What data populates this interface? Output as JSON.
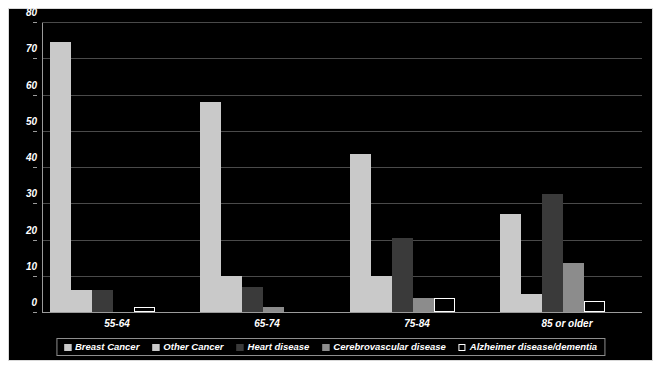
{
  "chart_data": {
    "type": "bar",
    "title": "",
    "subtitle": "",
    "xlabel": "",
    "ylabel": "",
    "grid": true,
    "legend_position": "bottom",
    "ylim": [
      0,
      80
    ],
    "ytick_labels": [
      "0",
      "10",
      "20",
      "30",
      "40",
      "50",
      "60",
      "70",
      "80"
    ],
    "ytick_values": [
      0,
      10,
      20,
      30,
      40,
      50,
      60,
      70,
      80
    ],
    "categories": [
      "55-64",
      "65-74",
      "75-84",
      "85 or older"
    ],
    "series": [
      {
        "name": "Breast Cancer",
        "color": "#c9c9c9",
        "values": [
          74.5,
          58,
          43.5,
          27
        ]
      },
      {
        "name": "Other Cancer",
        "color": "#c9c9c9",
        "values": [
          6,
          10,
          10,
          5
        ]
      },
      {
        "name": "Heart disease",
        "color": "#3a3a3a",
        "values": [
          6,
          7,
          20.5,
          32.5
        ]
      },
      {
        "name": "Cerebrovascular disease",
        "color": "#8c8c8c",
        "values": [
          0,
          1.5,
          4,
          13.5
        ]
      },
      {
        "name": "Alzheimer disease/dementia",
        "color": "#000000",
        "values": [
          1.5,
          0,
          4,
          3
        ]
      }
    ]
  },
  "legend": {
    "items": [
      {
        "label": "Breast Cancer"
      },
      {
        "label": "Other Cancer"
      },
      {
        "label": "Heart disease"
      },
      {
        "label": "Cerebrovascular disease"
      },
      {
        "label": "Alzheimer disease/dementia"
      }
    ]
  },
  "colors": {
    "background": "#000000",
    "page": "#ffffff",
    "axis": "#9b9b9b",
    "grid": "#4a4a4a",
    "text": "#ffffff",
    "border": "#d9d9d9",
    "series_breast_cancer": "#c9c9c9",
    "series_other_cancer": "#c9c9c9",
    "series_heart_disease": "#3a3a3a",
    "series_cerebrovascular": "#8c8c8c",
    "series_alzheimer": "#000000"
  }
}
